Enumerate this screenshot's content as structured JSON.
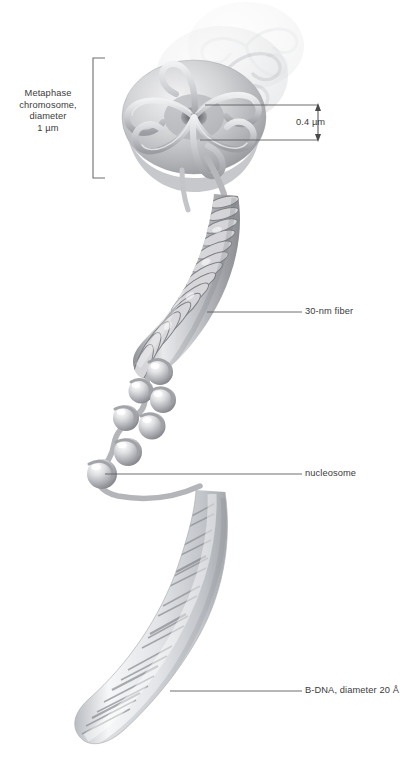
{
  "figure": {
    "background_color": "#ffffff",
    "ink_color": "#3b3b3b"
  },
  "labels": {
    "metaphase": {
      "line1": "Metaphase",
      "line2": "chromosome,",
      "line3": "diameter",
      "line4": "1 µm",
      "text": "Metaphase chromosome, diameter 1 µm"
    },
    "scale": {
      "text": "0.4 µm"
    },
    "fiber": {
      "text": "30-nm fiber"
    },
    "nucleosome": {
      "text": "nucleosome"
    },
    "bdna": {
      "text": "B-DNA, diameter 20 Å"
    }
  },
  "structures": [
    {
      "name": "metaphase-chromosome",
      "description": "stacked radial-loop rosette discs"
    },
    {
      "name": "thirty-nm-fiber",
      "description": "solenoid coil of stacked nucleosomes"
    },
    {
      "name": "beads-on-a-string",
      "description": "nucleosome beads joined by linker DNA"
    },
    {
      "name": "b-dna-double-helix",
      "description": "translucent cylinder with helical base pairs"
    }
  ]
}
